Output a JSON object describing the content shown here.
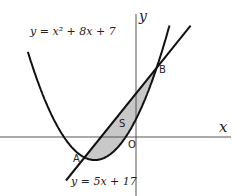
{
  "diagram": {
    "curve_label": "y = x² + 8x + 7",
    "line_label": "y = 5x + 17",
    "x_axis_label": "x",
    "y_axis_label": "y",
    "point_A": "A",
    "point_B": "B",
    "origin": "O",
    "region_label": "S",
    "colors": {
      "curve": "#111111",
      "axis": "#555555",
      "shade": "#c8c8c8"
    }
  }
}
